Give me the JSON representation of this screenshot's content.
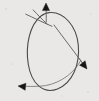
{
  "figure": {
    "kind": "line-drawing",
    "background_color": "#e9e8e6",
    "ink_color": "#4a4a4a",
    "arrow_color": "#161616",
    "width": 99,
    "height": 101
  },
  "elements": {
    "ellipse": {
      "name": "ellipse-outline",
      "center_x": 53,
      "center_y": 51,
      "radius_x": 25,
      "radius_y": 39,
      "rotation_deg": 4
    },
    "chord_upper": {
      "name": "upper-right-chord",
      "from_x": 54,
      "from_y": 25,
      "to_x": 84,
      "to_y": 65
    },
    "chord_crossing_a": {
      "name": "top-left-crossing-stroke-a",
      "from_x": 26,
      "from_y": 14,
      "to_x": 52,
      "to_y": 26
    },
    "chord_crossing_b": {
      "name": "top-left-crossing-stroke-b",
      "from_x": 33,
      "from_y": 10,
      "to_x": 47,
      "to_y": 24
    },
    "equator_arc": {
      "name": "lower-equator-arc",
      "from_x": 80,
      "from_y": 62,
      "to_x": 24,
      "to_y": 86
    },
    "tail_stub": {
      "name": "upper-tail-stub",
      "from_x": 46,
      "from_y": 22,
      "to_x": 46,
      "to_y": 9
    }
  },
  "arrows": [
    {
      "id": "arrow-top",
      "label": "top-arrowhead",
      "tip_x": 46,
      "tip_y": 3,
      "direction": "up",
      "angle_deg": 270
    },
    {
      "id": "arrow-right",
      "label": "right-arrowhead",
      "tip_x": 87,
      "tip_y": 69,
      "direction": "down-right",
      "angle_deg": 52
    },
    {
      "id": "arrow-bottom-left",
      "label": "bottom-left-arrowhead",
      "tip_x": 18,
      "tip_y": 86,
      "direction": "left",
      "angle_deg": 186
    }
  ],
  "specks": [
    {
      "x": 6,
      "y": 9,
      "r": 0.7
    },
    {
      "x": 91,
      "y": 14,
      "r": 0.6
    },
    {
      "x": 12,
      "y": 64,
      "r": 0.6
    },
    {
      "x": 88,
      "y": 92,
      "r": 0.7
    },
    {
      "x": 62,
      "y": 96,
      "r": 0.5
    },
    {
      "x": 30,
      "y": 38,
      "r": 0.5
    }
  ]
}
